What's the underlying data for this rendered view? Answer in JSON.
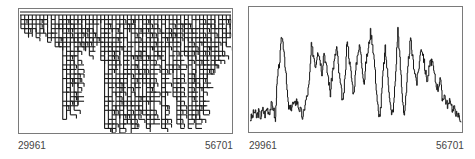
{
  "chart_data": [
    {
      "type": "heatmap",
      "title": "",
      "description": "Branching staircase diagram (tree-like hierarchical bars descending from top edge)",
      "x_range": [
        29961,
        56701
      ],
      "xlabel": "",
      "ylabel": "",
      "tick_labels": [
        "29961",
        "56701"
      ],
      "grid": false,
      "legend": null,
      "column_depth_fraction": [
        0.12,
        0.16,
        0.18,
        0.14,
        0.18,
        0.15,
        0.17,
        0.22,
        0.2,
        0.25,
        0.28,
        0.9,
        0.88,
        0.85,
        0.8,
        0.75,
        0.25,
        0.3,
        0.35,
        0.3,
        0.22,
        0.4,
        0.98,
        0.96,
        1.0,
        0.97,
        1.0,
        0.95,
        0.92,
        1.0,
        0.98,
        0.9,
        0.85,
        0.96,
        0.98,
        0.94,
        0.4,
        0.96,
        0.98,
        0.5,
        0.7,
        0.94,
        0.97,
        0.35,
        0.98,
        0.9,
        0.95,
        0.88,
        0.85,
        0.6,
        0.5,
        0.45,
        0.4,
        0.35,
        0.25,
        0.2
      ],
      "row_levels": 26
    },
    {
      "type": "line",
      "title": "",
      "x_range": [
        29961,
        56701
      ],
      "xlabel": "",
      "ylabel": "",
      "tick_labels": [
        "29961",
        "56701"
      ],
      "grid": false,
      "legend": null,
      "ylim": [
        0,
        1
      ],
      "x": [
        0,
        0.01,
        0.02,
        0.03,
        0.04,
        0.05,
        0.06,
        0.07,
        0.08,
        0.09,
        0.1,
        0.11,
        0.12,
        0.125,
        0.13,
        0.14,
        0.15,
        0.16,
        0.17,
        0.18,
        0.19,
        0.2,
        0.21,
        0.22,
        0.23,
        0.24,
        0.25,
        0.26,
        0.27,
        0.28,
        0.29,
        0.3,
        0.31,
        0.32,
        0.33,
        0.34,
        0.35,
        0.36,
        0.37,
        0.38,
        0.39,
        0.4,
        0.41,
        0.42,
        0.43,
        0.44,
        0.45,
        0.46,
        0.47,
        0.48,
        0.49,
        0.5,
        0.51,
        0.52,
        0.53,
        0.54,
        0.55,
        0.56,
        0.57,
        0.58,
        0.59,
        0.6,
        0.61,
        0.62,
        0.63,
        0.64,
        0.65,
        0.66,
        0.67,
        0.68,
        0.69,
        0.7,
        0.71,
        0.72,
        0.73,
        0.74,
        0.75,
        0.76,
        0.77,
        0.78,
        0.79,
        0.8,
        0.81,
        0.82,
        0.83,
        0.84,
        0.85,
        0.86,
        0.87,
        0.88,
        0.89,
        0.9,
        0.91,
        0.92,
        0.93,
        0.94,
        0.95,
        0.96,
        0.97,
        0.98,
        0.99,
        1.0
      ],
      "values": [
        0.08,
        0.1,
        0.15,
        0.1,
        0.14,
        0.1,
        0.16,
        0.12,
        0.18,
        0.14,
        0.2,
        0.18,
        0.05,
        0.3,
        0.45,
        0.6,
        0.82,
        0.7,
        0.45,
        0.2,
        0.15,
        0.22,
        0.2,
        0.25,
        0.18,
        0.15,
        0.08,
        0.22,
        0.28,
        0.4,
        0.72,
        0.65,
        0.55,
        0.7,
        0.62,
        0.5,
        0.68,
        0.55,
        0.45,
        0.3,
        0.5,
        0.6,
        0.72,
        0.5,
        0.35,
        0.22,
        0.45,
        0.8,
        0.6,
        0.45,
        0.3,
        0.5,
        0.68,
        0.72,
        0.55,
        0.4,
        0.6,
        0.7,
        0.85,
        0.75,
        0.55,
        0.3,
        0.08,
        0.2,
        0.5,
        0.7,
        0.5,
        0.3,
        0.1,
        0.2,
        0.5,
        0.88,
        0.6,
        0.3,
        0.12,
        0.3,
        0.6,
        0.78,
        0.62,
        0.5,
        0.4,
        0.55,
        0.72,
        0.65,
        0.5,
        0.42,
        0.55,
        0.6,
        0.5,
        0.4,
        0.35,
        0.45,
        0.25,
        0.3,
        0.22,
        0.2,
        0.25,
        0.15,
        0.18,
        0.1,
        0.12,
        0.05
      ]
    }
  ],
  "panels": {
    "left": {
      "x_min_label": "29961",
      "x_max_label": "56701"
    },
    "right": {
      "x_min_label": "29961",
      "x_max_label": "56701"
    }
  },
  "colors": {
    "ink": "#1a1a1a",
    "frame": "#7a7a7a",
    "label": "#444444"
  }
}
